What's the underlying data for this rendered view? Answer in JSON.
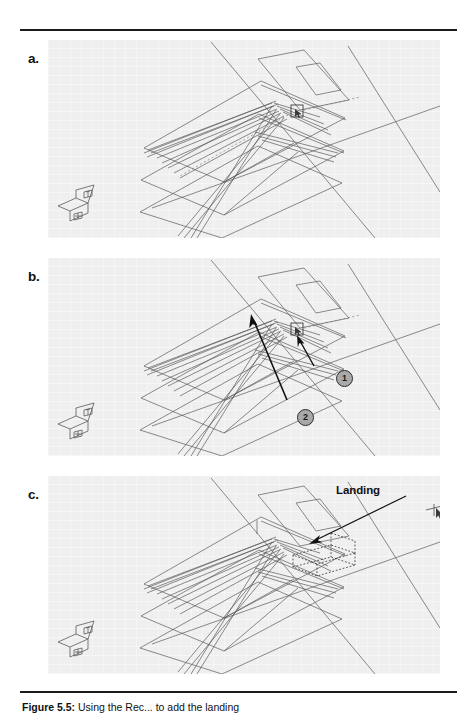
{
  "figure": {
    "panels": [
      {
        "id": "a",
        "label": "a.",
        "drawing_name": "isometric-stair-wireframe",
        "annotations": []
      },
      {
        "id": "b",
        "label": "b.",
        "drawing_name": "isometric-stair-wireframe",
        "annotations": [
          {
            "name": "callout-1",
            "text": "1"
          },
          {
            "name": "callout-2",
            "text": "2"
          }
        ]
      },
      {
        "id": "c",
        "label": "c.",
        "drawing_name": "isometric-stair-wireframe-with-landing",
        "annotations": [
          {
            "name": "landing-label",
            "text": "Landing"
          }
        ]
      }
    ]
  },
  "caption": {
    "figure_number": "Figure 5.5:",
    "text": " Using the Rec... to add the landing"
  },
  "colors": {
    "panel_background": "#efefef",
    "line": "#555555",
    "annotation": "#111111",
    "callout_fill": "#a9a9a9",
    "callout_border": "#2c2c2c",
    "rule": "#1b1b1b"
  }
}
